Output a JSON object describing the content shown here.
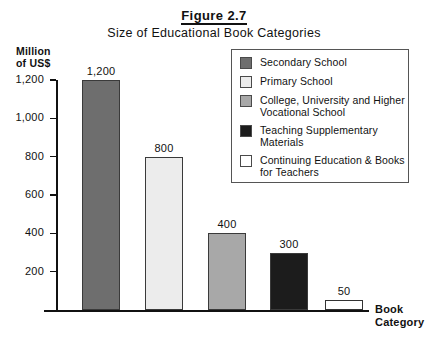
{
  "chart_data": {
    "type": "bar",
    "title": "Figure 2.7",
    "subtitle": "Size of Educational Book Categories",
    "xlabel": "Book Category",
    "ylabel": "Million of US$",
    "ylabel_line1": "Million",
    "ylabel_line2": "of US$",
    "ylim": [
      0,
      1200
    ],
    "yticks": [
      200,
      400,
      600,
      800,
      1000,
      1200
    ],
    "ytick_labels": [
      "200",
      "400",
      "600",
      "800",
      "1,000",
      "1,200"
    ],
    "grid": false,
    "legend_position": "upper-right-inset",
    "categories": [
      "Secondary School",
      "Primary School",
      "College, University and Higher Vocational School",
      "Teaching Supplementary Materials",
      "Continuing Education & Books for Teachers"
    ],
    "values": [
      1200,
      800,
      400,
      300,
      50
    ],
    "value_labels": [
      "1,200",
      "800",
      "400",
      "300",
      "50"
    ],
    "colors": [
      "#6e6e6e",
      "#ececec",
      "#a8a8a8",
      "#1c1c1c",
      "#ffffff"
    ]
  },
  "legend": {
    "items": [
      {
        "label_line1": "Secondary School",
        "label_line2": "",
        "color": "#6e6e6e"
      },
      {
        "label_line1": "Primary School",
        "label_line2": "",
        "color": "#ececec"
      },
      {
        "label_line1": "College, University and Higher",
        "label_line2": "Vocational School",
        "color": "#a8a8a8"
      },
      {
        "label_line1": "Teaching Supplementary",
        "label_line2": "Materials",
        "color": "#1c1c1c"
      },
      {
        "label_line1": "Continuing Education & Books",
        "label_line2": "for Teachers",
        "color": "#ffffff"
      }
    ]
  },
  "axis_title": {
    "line1": "Book",
    "line2": "Category"
  }
}
